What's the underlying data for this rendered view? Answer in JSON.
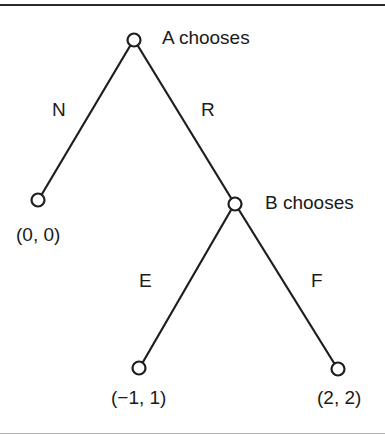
{
  "diagram": {
    "type": "game-tree",
    "colors": {
      "line": "#1e1e1e",
      "text": "#1a1a1a",
      "node_fill": "#ffffff"
    },
    "nodes": [
      {
        "id": "root",
        "label": "A chooses",
        "x": 134,
        "y": 40
      },
      {
        "id": "leaf_n",
        "payoff": "(0, 0)",
        "x": 38,
        "y": 200
      },
      {
        "id": "b_node",
        "label": "B chooses",
        "x": 235,
        "y": 204
      },
      {
        "id": "leaf_e",
        "payoff": "(−1, 1)",
        "x": 139,
        "y": 368
      },
      {
        "id": "leaf_f",
        "payoff": "(2, 2)",
        "x": 338,
        "y": 369
      }
    ],
    "edges": [
      {
        "from": "root",
        "to": "leaf_n",
        "label": "N"
      },
      {
        "from": "root",
        "to": "b_node",
        "label": "R"
      },
      {
        "from": "b_node",
        "to": "leaf_e",
        "label": "E"
      },
      {
        "from": "b_node",
        "to": "leaf_f",
        "label": "F"
      }
    ],
    "labels": {
      "a_chooses": "A chooses",
      "b_chooses": "B chooses",
      "n": "N",
      "r": "R",
      "e": "E",
      "f": "F",
      "payoff_n": "(0, 0)",
      "payoff_e": "(−1, 1)",
      "payoff_f": "(2, 2)"
    }
  }
}
